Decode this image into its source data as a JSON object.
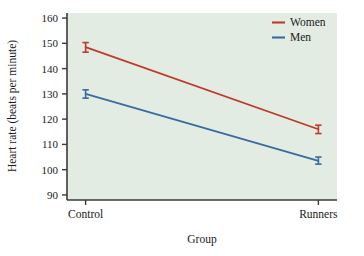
{
  "chart_data": {
    "type": "line",
    "title": "",
    "subtitle": "",
    "xlabel": "Group",
    "ylabel": "Heart rate (beats per minute)",
    "categories": [
      "Control",
      "Runners"
    ],
    "x": [
      0,
      1
    ],
    "xlim": [
      -0.08,
      1.08
    ],
    "ylim": [
      88,
      162
    ],
    "yticks": [
      90,
      100,
      110,
      120,
      130,
      140,
      150,
      160
    ],
    "ytick_labels": [
      "90",
      "100",
      "110",
      "120",
      "130",
      "140",
      "150",
      "160"
    ],
    "grid": false,
    "legend_position": "top-right",
    "plot_background": "#E3ECE3",
    "figure_background": "#FFFFFF",
    "axis_color": "#3A3A3A",
    "series": [
      {
        "name": "Women",
        "color": "#C0392B",
        "values": [
          148.5,
          116.0
        ],
        "error_low": [
          146.5,
          114.3
        ],
        "error_high": [
          150.3,
          117.6
        ]
      },
      {
        "name": "Men",
        "color": "#3A6B9E",
        "values": [
          130.0,
          103.5
        ],
        "error_low": [
          128.3,
          102.2
        ],
        "error_high": [
          131.6,
          105.0
        ]
      }
    ],
    "legend": [
      {
        "label": "Women",
        "color": "#C0392B"
      },
      {
        "label": "Men",
        "color": "#3A6B9E"
      }
    ]
  }
}
